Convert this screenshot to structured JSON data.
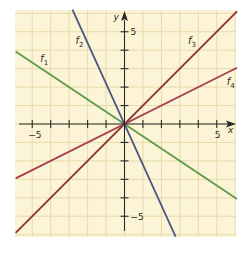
{
  "chart_data": {
    "type": "line",
    "title": "",
    "xlabel": "x",
    "ylabel": "y",
    "xlim": [
      -5.9,
      6.1
    ],
    "ylim": [
      -6.1,
      6.2
    ],
    "grid": true,
    "legend": "inline labels",
    "x_tick_labels": [
      {
        "value": -5,
        "label": "−5"
      },
      {
        "value": 5,
        "label": "5"
      }
    ],
    "y_tick_labels": [
      {
        "value": 5,
        "label": "5"
      },
      {
        "value": -5,
        "label": "−5"
      }
    ],
    "series": [
      {
        "name": "f1",
        "label_main": "f",
        "label_sub": "1",
        "slope": -0.6667,
        "intercept": 0,
        "color": "#5c9b4a",
        "x": [
          -5.9,
          6.1
        ],
        "y": [
          3.93,
          -4.07
        ],
        "label_pos": [
          -4.4,
          3.5
        ]
      },
      {
        "name": "f2",
        "label_main": "f",
        "label_sub": "2",
        "slope": -2.2,
        "intercept": 0,
        "color": "#4b5684",
        "x": [
          -2.82,
          2.77
        ],
        "y": [
          6.2,
          -6.1
        ],
        "label_pos": [
          -2.5,
          4.5
        ]
      },
      {
        "name": "f3",
        "label_main": "f",
        "label_sub": "3",
        "slope": 1.0,
        "intercept": 0,
        "color": "#8e2d2a",
        "x": [
          -5.9,
          6.1
        ],
        "y": [
          -5.9,
          6.1
        ],
        "label_pos": [
          3.6,
          4.5
        ]
      },
      {
        "name": "f4",
        "label_main": "f",
        "label_sub": "4",
        "slope": 0.5,
        "intercept": 0,
        "color": "#a63f52",
        "x": [
          -5.9,
          6.1
        ],
        "y": [
          -2.95,
          3.05
        ],
        "label_pos": [
          5.7,
          2.3
        ]
      }
    ]
  },
  "colors": {
    "background": "#fcf4d6",
    "grid": "#e6dbaa",
    "axis": "#2a2a2a"
  }
}
